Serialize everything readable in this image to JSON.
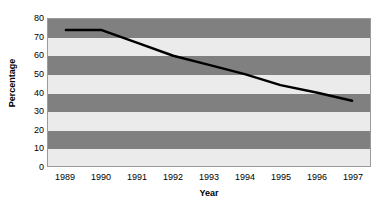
{
  "chart_data": {
    "type": "line",
    "title": "",
    "xlabel": "Year",
    "ylabel": "Percentage",
    "categories": [
      "1989",
      "1990",
      "1991",
      "1992",
      "1993",
      "1994",
      "1995",
      "1996",
      "1997"
    ],
    "x": [
      1989,
      1990,
      1991,
      1992,
      1993,
      1994,
      1995,
      1996,
      1997
    ],
    "values": [
      74,
      74,
      67,
      60,
      55,
      50,
      44,
      40,
      35.5
    ],
    "series": [
      {
        "name": "Percentage",
        "values": [
          74,
          74,
          67,
          60,
          55,
          50,
          44,
          40,
          35.5
        ]
      }
    ],
    "ylim": [
      0,
      80
    ],
    "ytick_step": 10,
    "yticks": [
      "80",
      "70",
      "60",
      "50",
      "40",
      "30",
      "20",
      "10",
      "0"
    ],
    "ytick_values": [
      80,
      70,
      60,
      50,
      40,
      30,
      20,
      10,
      0
    ],
    "grid": false,
    "banded_background": true,
    "legend": "none",
    "line_color": "#000000",
    "band_dark_color": "#808080",
    "band_light_color": "#ebebeb",
    "plot_border_color": "#9a9a9a",
    "background_color": "#ffffff"
  }
}
